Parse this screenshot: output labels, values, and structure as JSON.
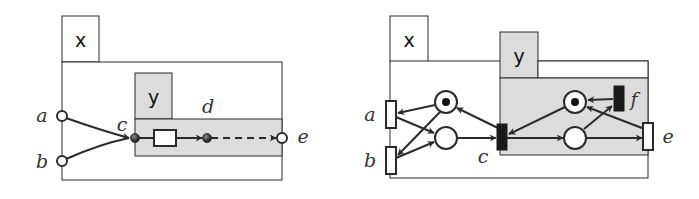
{
  "colors": {
    "stroke": "#2a2a2a",
    "gray_fill": "#dcdcdc",
    "white": "#ffffff",
    "token": "#111111",
    "black_transition": "#1a1a1a"
  },
  "left_diagram": {
    "outer_tab_label": "x",
    "inner_tab_label": "y",
    "labels": {
      "a": "a",
      "b": "b",
      "c": "c",
      "d": "d",
      "e": "e"
    }
  },
  "right_diagram": {
    "outer_tab_label": "x",
    "inner_tab_label": "y",
    "labels": {
      "a": "a",
      "b": "b",
      "c": "c",
      "e": "e",
      "f": "f"
    }
  }
}
